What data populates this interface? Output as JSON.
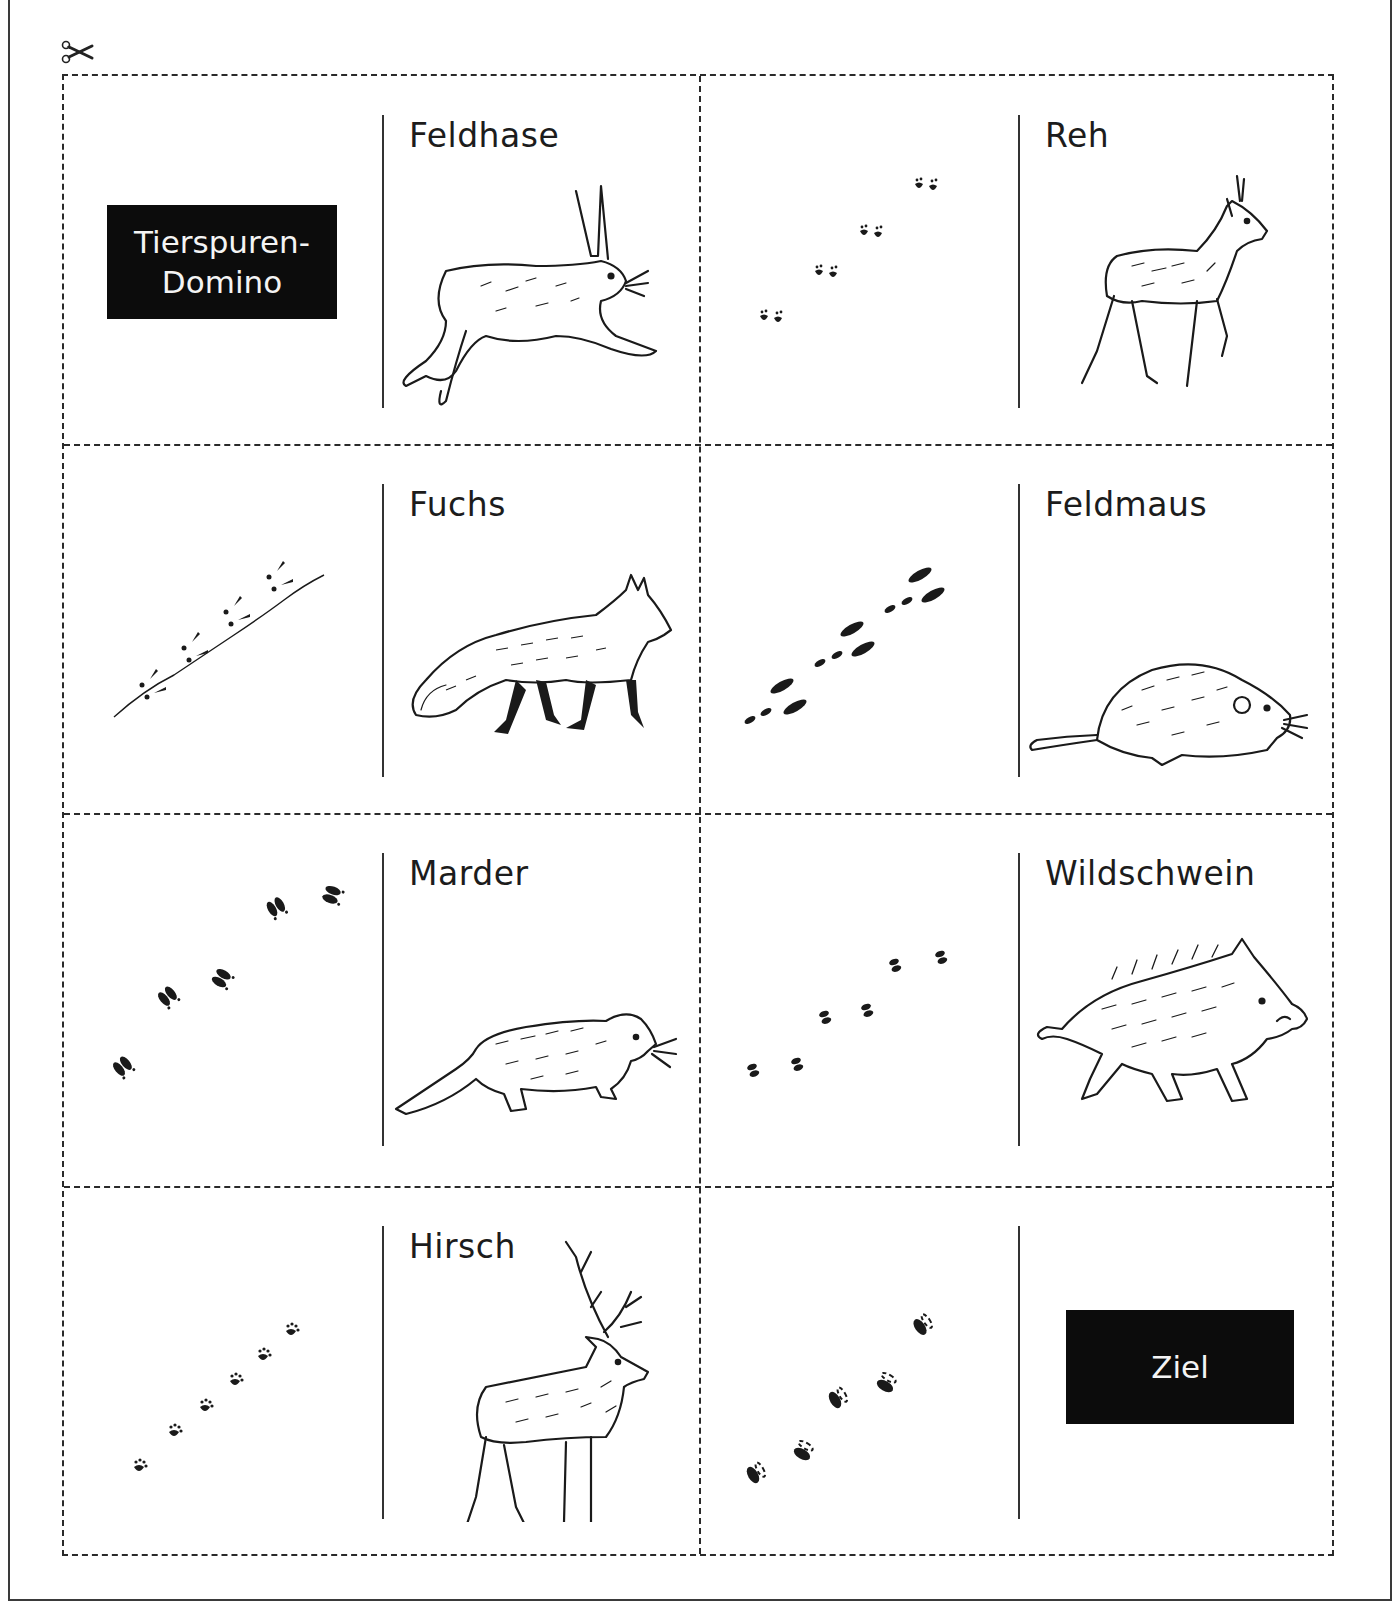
{
  "document": {
    "type": "Ausschneidebogen",
    "cut_hint_icon": "scissors-icon"
  },
  "title_card": {
    "line1": "Tierspuren-",
    "line2": "Domino"
  },
  "goal_card": {
    "label": "Ziel"
  },
  "cards": [
    {
      "position": "row1-left",
      "tracks": "start",
      "animal": "Feldhase",
      "animal_icon": "hare-icon"
    },
    {
      "position": "row1-right",
      "tracks": "paw-pairs",
      "animal": "Reh",
      "animal_icon": "roe-deer-icon"
    },
    {
      "position": "row2-left",
      "tracks": "bird-tracks-with-line",
      "animal": "Fuchs",
      "animal_icon": "fox-icon"
    },
    {
      "position": "row2-right",
      "tracks": "hare-hops",
      "animal": "Feldmaus",
      "animal_icon": "vole-icon"
    },
    {
      "position": "row3-left",
      "tracks": "split-hoof",
      "animal": "Marder",
      "animal_icon": "marten-icon"
    },
    {
      "position": "row3-right",
      "tracks": "small-hoof",
      "animal": "Wildschwein",
      "animal_icon": "wild-boar-icon"
    },
    {
      "position": "row4-left",
      "tracks": "small-paws",
      "animal": "Hirsch",
      "animal_icon": "red-deer-icon"
    },
    {
      "position": "row4-right",
      "tracks": "boar-hoof",
      "animal": "Ziel",
      "animal_icon": "goal-label"
    }
  ],
  "colors": {
    "ink": "#1a1a1a",
    "label_box": "#0c0c0c",
    "label_box_text": "#f4f4f4",
    "dashed_border": "#2a2a2a"
  }
}
